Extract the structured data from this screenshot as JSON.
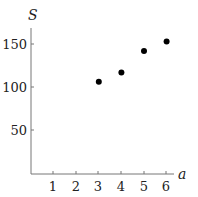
{
  "chart_data": {
    "type": "scatter",
    "title": "",
    "xlabel": "a",
    "ylabel": "S",
    "x": [
      3,
      4,
      5,
      6
    ],
    "series": [
      {
        "name": "S",
        "values": [
          106,
          117,
          142,
          153
        ]
      }
    ],
    "xticks": [
      1,
      2,
      3,
      4,
      5,
      6
    ],
    "yticks": [
      50,
      100,
      150
    ],
    "xlim": [
      0,
      6.5
    ],
    "ylim": [
      0,
      170
    ],
    "grid": false,
    "legend": null
  },
  "labels": {
    "xlabel": "a",
    "ylabel": "S",
    "xticks": [
      "1",
      "2",
      "3",
      "4",
      "5",
      "6"
    ],
    "yticks": [
      "50",
      "100",
      "150"
    ]
  }
}
